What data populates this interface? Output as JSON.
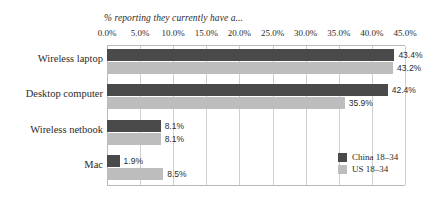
{
  "chart_data": {
    "type": "bar",
    "orientation": "horizontal",
    "title": "% reporting they currently have a...",
    "xlabel": "",
    "ylabel": "",
    "xlim": [
      0,
      45
    ],
    "xticks": [
      "0.0%",
      "5.0%",
      "10.0%",
      "15.0%",
      "20.0%",
      "25.0%",
      "30.0%",
      "35.0%",
      "40.0%",
      "45.0%"
    ],
    "xtick_values": [
      0,
      5,
      10,
      15,
      20,
      25,
      30,
      35,
      40,
      45
    ],
    "grid": true,
    "legend_position": "bottom-right",
    "categories": [
      "Wireless laptop",
      "Desktop computer",
      "Wireless netbook",
      "Mac"
    ],
    "series": [
      {
        "name": "China 18–34",
        "color": "#4a4a4a",
        "values": [
          43.4,
          42.4,
          8.1,
          1.9
        ],
        "labels": [
          "43.4%",
          "42.4%",
          "8.1%",
          "1.9%"
        ]
      },
      {
        "name": "US 18–34",
        "color": "#bdbdbd",
        "values": [
          43.2,
          35.9,
          8.1,
          8.5
        ],
        "labels": [
          "43.2%",
          "35.9%",
          "8.1%",
          "8.5%"
        ]
      }
    ]
  },
  "colors": {
    "china": "#4a4a4a",
    "us": "#bdbdbd",
    "gridline": "#cfcfcf",
    "axis": "#b9b9b9",
    "text": "#2b2b2b",
    "background": "#ffffff"
  }
}
